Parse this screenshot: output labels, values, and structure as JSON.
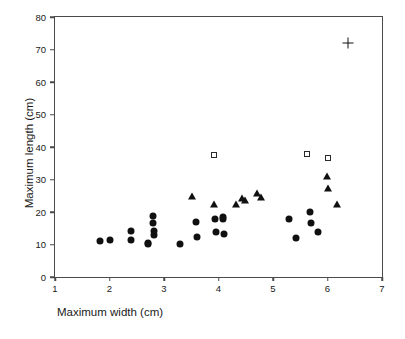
{
  "chart_data": {
    "type": "scatter",
    "title": "",
    "xlabel": "Maximum width (cm)",
    "ylabel": "Maximum length (cm)",
    "xlim": [
      1,
      7
    ],
    "ylim": [
      0,
      80
    ],
    "xticks": [
      "1",
      "2",
      "3",
      "4",
      "5",
      "6",
      "7"
    ],
    "yticks": [
      "0",
      "10",
      "20",
      "30",
      "40",
      "50",
      "60",
      "70",
      "80"
    ],
    "grid": false,
    "legend": "none",
    "series": [
      {
        "name": "filled-circle",
        "marker": "circle",
        "color": "#101010",
        "points": [
          [
            1.82,
            11.2
          ],
          [
            2.01,
            11.5
          ],
          [
            2.39,
            14.1
          ],
          [
            2.4,
            11.5
          ],
          [
            2.7,
            10.6
          ],
          [
            2.71,
            10.2
          ],
          [
            2.79,
            18.7
          ],
          [
            2.8,
            16.6
          ],
          [
            2.81,
            14.3
          ],
          [
            2.82,
            13.0
          ],
          [
            3.3,
            10.2
          ],
          [
            3.59,
            16.9
          ],
          [
            3.61,
            12.4
          ],
          [
            3.94,
            17.7
          ],
          [
            3.95,
            13.9
          ],
          [
            4.08,
            18.6
          ],
          [
            4.09,
            17.9
          ],
          [
            4.1,
            13.2
          ],
          [
            5.3,
            17.9
          ],
          [
            5.42,
            12.0
          ],
          [
            5.68,
            20.1
          ],
          [
            5.69,
            16.6
          ],
          [
            5.82,
            13.9
          ]
        ]
      },
      {
        "name": "filled-triangle",
        "marker": "triangle",
        "color": "#101010",
        "points": [
          [
            3.51,
            24.9
          ],
          [
            3.92,
            22.6
          ],
          [
            4.32,
            22.5
          ],
          [
            4.44,
            24.3
          ],
          [
            4.48,
            23.7
          ],
          [
            4.7,
            25.8
          ],
          [
            4.78,
            24.6
          ],
          [
            5.99,
            31.0
          ],
          [
            6.0,
            27.5
          ],
          [
            6.18,
            22.5
          ]
        ]
      },
      {
        "name": "open-square",
        "marker": "square",
        "color": "#2a2a2a",
        "points": [
          [
            3.91,
            37.5
          ],
          [
            5.62,
            37.9
          ],
          [
            6.0,
            36.5
          ]
        ]
      },
      {
        "name": "plus",
        "marker": "plus",
        "color": "#101010",
        "points": [
          [
            6.38,
            72.0
          ]
        ]
      }
    ]
  }
}
